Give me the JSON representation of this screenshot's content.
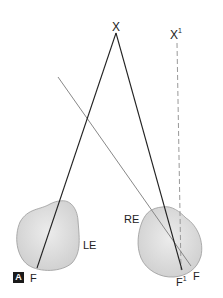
{
  "figure": {
    "panel_label": "A",
    "points": {
      "fixation": "X",
      "fixation_prime": "X",
      "fixation_prime_sup": "1"
    },
    "eyes": {
      "left": "LE",
      "right": "RE"
    },
    "fovea": {
      "left": "F",
      "right": "F",
      "right_prime": "F",
      "right_prime_sup": "1"
    },
    "colors": {
      "eye_fill": "#dcdcdc",
      "eye_stroke": "#999999",
      "visual_axis": "#222222",
      "deviated_axis": "#888888",
      "dashed_axis": "#999999"
    }
  }
}
